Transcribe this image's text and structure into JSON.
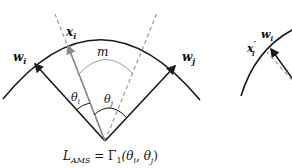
{
  "diagram": {
    "labels": {
      "w_i": "w",
      "w_i_sub": "i",
      "w_j": "w",
      "w_j_sub": "j",
      "x_i": "x",
      "x_i_sub": "i",
      "m": "m",
      "theta_i": "θ",
      "theta_i_sub": "i",
      "theta_j": "θ",
      "theta_j_sub": "j",
      "w_i_right": "w",
      "w_i_right_sub": "i",
      "x_i_prime": "x",
      "x_i_prime_sup": "′",
      "x_i_prime_sub": "i"
    },
    "formula": {
      "lhs": "L",
      "lhs_sub": "AMS",
      "eq": " = Γ",
      "gamma_sub": "1",
      "args": "(θ",
      "arg1_sub": "i",
      "comma": ", θ",
      "arg2_sub": "j",
      "close": ")"
    },
    "colors": {
      "line": "#1a1a1a",
      "arrow_gray": "#8a8a8a",
      "dashed": "#9a9a9a"
    }
  }
}
